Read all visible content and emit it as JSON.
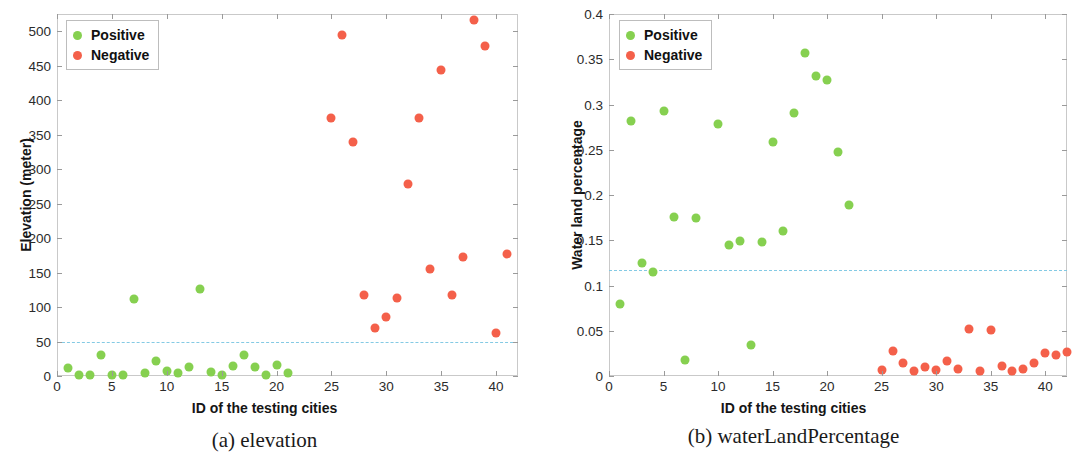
{
  "figure": {
    "panels": [
      {
        "caption": "(a) elevation",
        "xlabel": "ID of the testing cities",
        "ylabel": "Elevation (meter)",
        "legend": {
          "positive": "Positive",
          "negative": "Negative"
        }
      },
      {
        "caption": "(b) waterLandPercentage",
        "xlabel": "ID of the testing cities",
        "ylabel": "Water land percentage",
        "legend": {
          "positive": "Positive",
          "negative": "Negative"
        }
      }
    ]
  },
  "colors": {
    "positive": "#86d050",
    "negative": "#f4604a",
    "threshold": "#7ec8e3",
    "axis": "#c9c9c9",
    "text": "#1a1a1a"
  },
  "chart_data": [
    {
      "type": "scatter",
      "title": "(a) elevation",
      "xlabel": "ID of the testing cities",
      "ylabel": "Elevation (meter)",
      "xlim": [
        0,
        42
      ],
      "ylim": [
        0,
        525
      ],
      "xticks": [
        0,
        5,
        10,
        15,
        20,
        25,
        30,
        35,
        40
      ],
      "xticklabels": [
        "0",
        "5",
        "10",
        "15",
        "20",
        "25",
        "30",
        "35",
        "40"
      ],
      "yticks": [
        0,
        50,
        100,
        150,
        200,
        250,
        300,
        350,
        400,
        450,
        500
      ],
      "yticklabels": [
        "0",
        "50",
        "100",
        "150",
        "200",
        "250",
        "300",
        "350",
        "400",
        "450",
        "500"
      ],
      "grid": false,
      "legend_position": "top-left",
      "threshold": 50,
      "threshold_style": "dashed",
      "series": [
        {
          "name": "Positive",
          "color": "#86d050",
          "points": [
            {
              "x": 1,
              "y": 12
            },
            {
              "x": 2,
              "y": 1
            },
            {
              "x": 3,
              "y": 1
            },
            {
              "x": 4,
              "y": 31
            },
            {
              "x": 5,
              "y": 1
            },
            {
              "x": 6,
              "y": 1
            },
            {
              "x": 8,
              "y": 5
            },
            {
              "x": 9,
              "y": 22
            },
            {
              "x": 10,
              "y": 7
            },
            {
              "x": 11,
              "y": 4
            },
            {
              "x": 12,
              "y": 13
            },
            {
              "x": 13,
              "y": 126
            },
            {
              "x": 14,
              "y": 6
            },
            {
              "x": 15,
              "y": 2
            },
            {
              "x": 16,
              "y": 14
            },
            {
              "x": 17,
              "y": 30
            },
            {
              "x": 18,
              "y": 13
            },
            {
              "x": 19,
              "y": 1
            },
            {
              "x": 20,
              "y": 16
            },
            {
              "x": 21,
              "y": 4
            },
            {
              "x": 7,
              "y": 112
            }
          ]
        },
        {
          "name": "Negative",
          "color": "#f4604a",
          "points": [
            {
              "x": 25,
              "y": 374
            },
            {
              "x": 26,
              "y": 495
            },
            {
              "x": 27,
              "y": 340
            },
            {
              "x": 28,
              "y": 118
            },
            {
              "x": 29,
              "y": 70
            },
            {
              "x": 30,
              "y": 86
            },
            {
              "x": 31,
              "y": 113
            },
            {
              "x": 32,
              "y": 279
            },
            {
              "x": 33,
              "y": 374
            },
            {
              "x": 34,
              "y": 155
            },
            {
              "x": 35,
              "y": 444
            },
            {
              "x": 36,
              "y": 118
            },
            {
              "x": 37,
              "y": 173
            },
            {
              "x": 38,
              "y": 517
            },
            {
              "x": 39,
              "y": 478
            },
            {
              "x": 40,
              "y": 63
            },
            {
              "x": 41,
              "y": 177
            }
          ]
        }
      ]
    },
    {
      "type": "scatter",
      "title": "(b) waterLandPercentage",
      "xlabel": "ID of the testing cities",
      "ylabel": "Water land percentage",
      "xlim": [
        0,
        42
      ],
      "ylim": [
        0,
        0.4
      ],
      "xticks": [
        0,
        5,
        10,
        15,
        20,
        25,
        30,
        35,
        40
      ],
      "xticklabels": [
        "0",
        "5",
        "10",
        "15",
        "20",
        "25",
        "30",
        "35",
        "40"
      ],
      "yticks": [
        0,
        0.05,
        0.1,
        0.15,
        0.2,
        0.25,
        0.3,
        0.35,
        0.4
      ],
      "yticklabels": [
        "0",
        "0.05",
        "0.1",
        "0.15",
        "0.2",
        "0.25",
        "0.3",
        "0.35",
        "0.4"
      ],
      "grid": false,
      "legend_position": "top-left",
      "threshold": 0.117,
      "threshold_style": "dashed",
      "series": [
        {
          "name": "Positive",
          "color": "#86d050",
          "points": [
            {
              "x": 1,
              "y": 0.08
            },
            {
              "x": 2,
              "y": 0.282
            },
            {
              "x": 3,
              "y": 0.125
            },
            {
              "x": 4,
              "y": 0.115
            },
            {
              "x": 5,
              "y": 0.293
            },
            {
              "x": 6,
              "y": 0.176
            },
            {
              "x": 7,
              "y": 0.018
            },
            {
              "x": 8,
              "y": 0.175
            },
            {
              "x": 10,
              "y": 0.279
            },
            {
              "x": 11,
              "y": 0.145
            },
            {
              "x": 12,
              "y": 0.149
            },
            {
              "x": 13,
              "y": 0.034
            },
            {
              "x": 14,
              "y": 0.148
            },
            {
              "x": 15,
              "y": 0.259
            },
            {
              "x": 16,
              "y": 0.16
            },
            {
              "x": 17,
              "y": 0.291
            },
            {
              "x": 18,
              "y": 0.357
            },
            {
              "x": 19,
              "y": 0.332
            },
            {
              "x": 20,
              "y": 0.327
            },
            {
              "x": 21,
              "y": 0.247
            },
            {
              "x": 22,
              "y": 0.189
            }
          ]
        },
        {
          "name": "Negative",
          "color": "#f4604a",
          "points": [
            {
              "x": 25,
              "y": 0.007
            },
            {
              "x": 26,
              "y": 0.028
            },
            {
              "x": 27,
              "y": 0.014
            },
            {
              "x": 28,
              "y": 0.005
            },
            {
              "x": 29,
              "y": 0.01
            },
            {
              "x": 30,
              "y": 0.007
            },
            {
              "x": 31,
              "y": 0.017
            },
            {
              "x": 32,
              "y": 0.008
            },
            {
              "x": 33,
              "y": 0.052
            },
            {
              "x": 34,
              "y": 0.006
            },
            {
              "x": 35,
              "y": 0.051
            },
            {
              "x": 36,
              "y": 0.011
            },
            {
              "x": 37,
              "y": 0.005
            },
            {
              "x": 38,
              "y": 0.008
            },
            {
              "x": 39,
              "y": 0.014
            },
            {
              "x": 40,
              "y": 0.025
            },
            {
              "x": 41,
              "y": 0.023
            },
            {
              "x": 42,
              "y": 0.026
            }
          ]
        }
      ]
    }
  ]
}
